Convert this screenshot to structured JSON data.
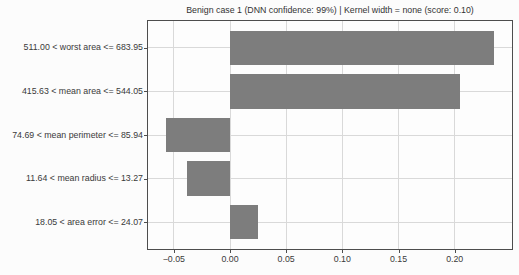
{
  "chart_data": {
    "type": "bar",
    "orientation": "horizontal",
    "title": "Benign case 1 (DNN confidence: 99%) | Kernel width = none (score: 0.10)",
    "categories": [
      "511.00 < worst area <= 683.95",
      "415.63 < mean area <= 544.05",
      "74.69 < mean perimeter <= 85.94",
      "11.64 < mean radius <= 13.27",
      "18.05 < area error <= 24.07"
    ],
    "values": [
      0.235,
      0.205,
      -0.057,
      -0.038,
      0.025
    ],
    "xlabel": "",
    "ylabel": "",
    "xticks": [
      -0.05,
      0.0,
      0.05,
      0.1,
      0.15,
      0.2
    ],
    "xtick_labels": [
      "−0.05",
      "0.00",
      "0.05",
      "0.10",
      "0.15",
      "0.20"
    ],
    "xlim": [
      -0.073,
      0.251
    ],
    "grid": true,
    "legend": "none",
    "colors": {
      "bar": "#7d7d7d",
      "grid": "#d9d9d9",
      "spine": "#4d4d4d",
      "text": "#3a3a3a",
      "background": "#fcfcfc"
    }
  }
}
